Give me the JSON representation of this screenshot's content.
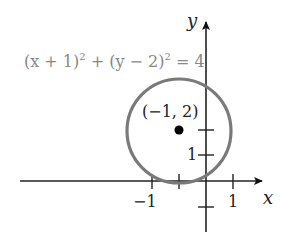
{
  "diagram": {
    "equation": {
      "part1": "(x + 1)",
      "exp1": "2",
      "plus": " + (y − 2)",
      "exp2": "2",
      "rhs": " = 4"
    },
    "center_label": "(−1, 2)",
    "axes": {
      "x_label": "x",
      "y_label": "y"
    },
    "tick_labels": {
      "x_neg1": "−1",
      "x_pos1": "1",
      "y_pos1": "1"
    },
    "circle": {
      "center": [
        -1,
        2
      ],
      "radius": 2,
      "stroke_color": "#7a7a7a"
    },
    "center_point_color": "#000000"
  }
}
